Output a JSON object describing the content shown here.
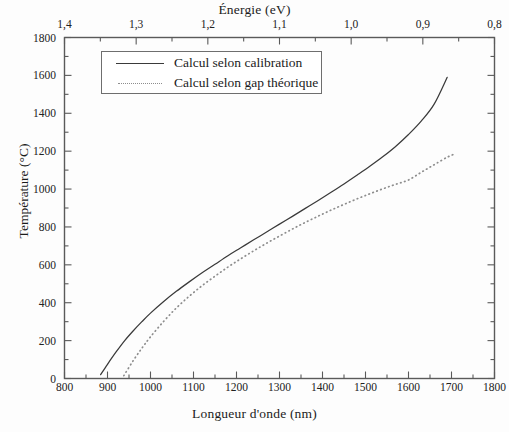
{
  "chart_data": {
    "type": "line",
    "title": "",
    "xlabel": "Longueur d'onde (nm)",
    "ylabel": "Température (°C)",
    "secondary_xlabel": "Énergie (eV)",
    "xlim": [
      800,
      1800
    ],
    "ylim": [
      0,
      1800
    ],
    "secondary_xlim": [
      1.4,
      0.8
    ],
    "xticks": [
      "800",
      "900",
      "1000",
      "1100",
      "1200",
      "1300",
      "1400",
      "1500",
      "1600",
      "1700",
      "1800"
    ],
    "xtick_values": [
      800,
      900,
      1000,
      1100,
      1200,
      1300,
      1400,
      1500,
      1600,
      1700,
      1800
    ],
    "yticks": [
      "0",
      "200",
      "400",
      "600",
      "800",
      "1000",
      "1200",
      "1400",
      "1600",
      "1800"
    ],
    "ytick_values": [
      0,
      200,
      400,
      600,
      800,
      1000,
      1200,
      1400,
      1600,
      1800
    ],
    "secondary_xticks": [
      "1,4",
      "1,3",
      "1,2",
      "1,1",
      "1,0",
      "0,9",
      "0,8"
    ],
    "secondary_xtick_values": [
      1.4,
      1.3,
      1.2,
      1.1,
      1.0,
      0.9,
      0.8
    ],
    "grid": false,
    "legend_position": "upper left",
    "series": [
      {
        "name": "Calcul selon calibration",
        "style": "solid",
        "color": "#3a3a3a",
        "x": [
          884,
          900,
          920,
          940,
          960,
          980,
          1000,
          1030,
          1060,
          1090,
          1120,
          1150,
          1180,
          1210,
          1240,
          1270,
          1300,
          1330,
          1360,
          1390,
          1420,
          1450,
          1480,
          1510,
          1540,
          1570,
          1600,
          1630,
          1660,
          1690
        ],
        "y": [
          20,
          75,
          140,
          200,
          252,
          300,
          345,
          405,
          460,
          510,
          558,
          603,
          648,
          690,
          732,
          773,
          815,
          856,
          898,
          940,
          983,
          1027,
          1073,
          1120,
          1170,
          1225,
          1288,
          1360,
          1450,
          1590
        ]
      },
      {
        "name": "Calcul selon gap théorique",
        "style": "dotted",
        "color": "#8d8d8d",
        "x": [
          938,
          960,
          980,
          1000,
          1030,
          1060,
          1090,
          1120,
          1150,
          1180,
          1210,
          1240,
          1270,
          1300,
          1330,
          1360,
          1390,
          1420,
          1450,
          1480,
          1510,
          1540,
          1570,
          1600,
          1630,
          1660,
          1690,
          1710
        ],
        "y": [
          15,
          95,
          160,
          220,
          300,
          372,
          434,
          490,
          540,
          588,
          632,
          674,
          714,
          752,
          789,
          824,
          857,
          889,
          919,
          948,
          975,
          1001,
          1025,
          1048,
          1089,
          1129,
          1168,
          1188
        ]
      }
    ]
  },
  "legend": {
    "entries": [
      {
        "label": "Calcul selon calibration"
      },
      {
        "label": "Calcul selon gap théorique"
      }
    ]
  }
}
